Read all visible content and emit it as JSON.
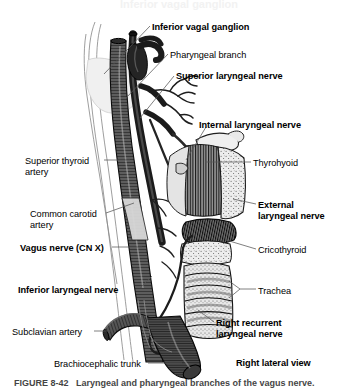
{
  "figure": {
    "domain": "anatomical-illustration",
    "view_label": "Right lateral view",
    "caption": "FIGURE 8-42   Laryngeal and pharyngeal branches of the vagus nerve.",
    "background": "#ffffff",
    "ink": "#111111"
  },
  "labels": [
    {
      "id": "inferior-vagal-ganglion",
      "text": "Inferior vagal ganglion",
      "weight": "bold",
      "x": 152,
      "y": 22
    },
    {
      "id": "pharyngeal-branch",
      "text": "Pharyngeal branch",
      "weight": "normal",
      "x": 170,
      "y": 50
    },
    {
      "id": "superior-laryngeal-nerve",
      "text": "Superior laryngeal nerve",
      "weight": "bold",
      "x": 176,
      "y": 71
    },
    {
      "id": "internal-laryngeal-nerve",
      "text": "Internal laryngeal nerve",
      "weight": "bold",
      "x": 199,
      "y": 120
    },
    {
      "id": "thyrohyoid",
      "text": "Thyrohyoid",
      "weight": "normal",
      "x": 253,
      "y": 158
    },
    {
      "id": "superior-thyroid-artery",
      "text": "Superior thyroid\nartery",
      "weight": "normal",
      "x": 25,
      "y": 156
    },
    {
      "id": "common-carotid-artery",
      "text": "Common carotid\nartery",
      "weight": "normal",
      "x": 30,
      "y": 209
    },
    {
      "id": "external-laryngeal-nerve",
      "text": "External\nlaryngeal nerve",
      "weight": "bold",
      "x": 258,
      "y": 200
    },
    {
      "id": "vagus-nerve-cn-x",
      "text": "Vagus nerve (CN X)",
      "weight": "bold",
      "x": 20,
      "y": 243
    },
    {
      "id": "cricothyroid",
      "text": "Cricothyroid",
      "weight": "normal",
      "x": 258,
      "y": 245
    },
    {
      "id": "inferior-laryngeal-nerve",
      "text": "Inferior laryngeal nerve",
      "weight": "bold",
      "x": 18,
      "y": 285
    },
    {
      "id": "trachea",
      "text": "Trachea",
      "weight": "normal",
      "x": 258,
      "y": 286
    },
    {
      "id": "subclavian-artery",
      "text": "Subclavian artery",
      "weight": "normal",
      "x": 12,
      "y": 327
    },
    {
      "id": "right-recurrent-laryngeal-nerve",
      "text": "Right recurrent\nlaryngeal nerve",
      "weight": "bold",
      "x": 216,
      "y": 318
    },
    {
      "id": "brachiocephalic-trunk",
      "text": "Brachiocephalic trunk",
      "weight": "normal",
      "x": 54,
      "y": 359
    },
    {
      "id": "right-lateral-view",
      "text": "Right lateral view",
      "weight": "bold",
      "x": 236,
      "y": 358
    }
  ],
  "structures": [
    {
      "id": "common-carotid-artery",
      "kind": "vessel",
      "render": "dark-hatched-tube"
    },
    {
      "id": "internal-jugular-outline",
      "kind": "vein",
      "render": "thin-outline"
    },
    {
      "id": "vagus-nerve-trunk",
      "kind": "nerve",
      "render": "dark-branching-cord"
    },
    {
      "id": "inferior-vagal-ganglion",
      "kind": "nerve",
      "render": "fusiform-swelling"
    },
    {
      "id": "superior-laryngeal-nerve",
      "kind": "nerve",
      "render": "branching-cord"
    },
    {
      "id": "pharyngeal-branch",
      "kind": "nerve",
      "render": "fine-arborizing-branches"
    },
    {
      "id": "thyrohyoid-muscle",
      "kind": "muscle",
      "render": "vertical-striations"
    },
    {
      "id": "thyroid-cartilage",
      "kind": "cartilage",
      "render": "stippled-plate"
    },
    {
      "id": "cricothyroid-muscle",
      "kind": "muscle",
      "render": "dark-oblique-fibers"
    },
    {
      "id": "trachea",
      "kind": "airway",
      "render": "stippled-rings"
    },
    {
      "id": "subclavian-artery",
      "kind": "vessel",
      "render": "curved-hatched-tube"
    },
    {
      "id": "brachiocephalic-trunk",
      "kind": "vessel",
      "render": "large-hatched-tube"
    }
  ]
}
